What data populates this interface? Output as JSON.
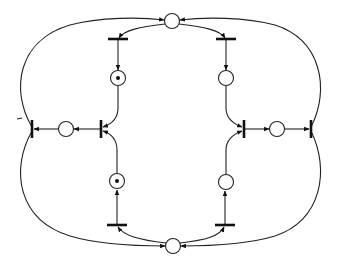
{
  "diagram": {
    "type": "petri-net",
    "colors": {
      "stroke": "#222222",
      "background": "#ffffff",
      "token": "#111111"
    },
    "places": [
      {
        "id": "p_top",
        "x": 172,
        "y": 21,
        "tokens": 0
      },
      {
        "id": "p_upper_left",
        "x": 118,
        "y": 78,
        "tokens": 1
      },
      {
        "id": "p_upper_right",
        "x": 226,
        "y": 78,
        "tokens": 0
      },
      {
        "id": "p_left",
        "x": 66,
        "y": 129,
        "tokens": 0
      },
      {
        "id": "p_right",
        "x": 277,
        "y": 129,
        "tokens": 0
      },
      {
        "id": "p_lower_left",
        "x": 117,
        "y": 181,
        "tokens": 1
      },
      {
        "id": "p_lower_right",
        "x": 226,
        "y": 182,
        "tokens": 0
      },
      {
        "id": "p_bottom",
        "x": 173,
        "y": 246,
        "tokens": 0
      }
    ],
    "transitions": [
      {
        "id": "t_top_left",
        "x": 118,
        "y": 39,
        "orientation": "horizontal"
      },
      {
        "id": "t_top_right",
        "x": 226,
        "y": 39,
        "orientation": "horizontal"
      },
      {
        "id": "t_outer_left",
        "x": 32,
        "y": 129,
        "orientation": "vertical"
      },
      {
        "id": "t_inner_left",
        "x": 101,
        "y": 129,
        "orientation": "vertical"
      },
      {
        "id": "t_inner_right",
        "x": 244,
        "y": 129,
        "orientation": "vertical"
      },
      {
        "id": "t_outer_right",
        "x": 311,
        "y": 129,
        "orientation": "vertical"
      },
      {
        "id": "t_bottom_left",
        "x": 117,
        "y": 225,
        "orientation": "horizontal"
      },
      {
        "id": "t_bottom_right",
        "x": 225,
        "y": 225,
        "orientation": "horizontal"
      }
    ]
  }
}
